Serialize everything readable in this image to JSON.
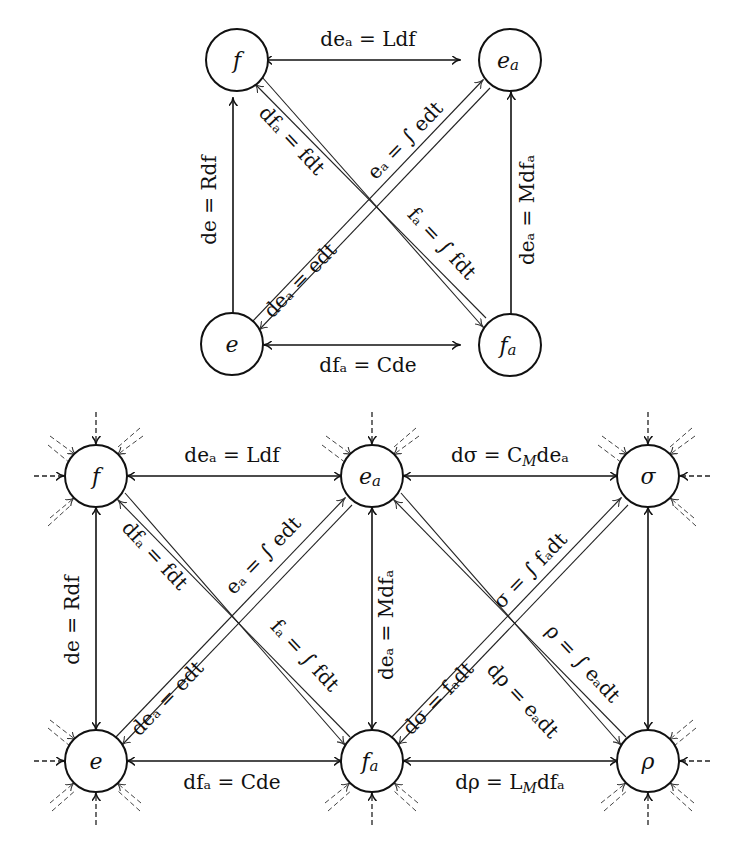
{
  "diagrams": [
    {
      "name": "top-diagram",
      "nodes": [
        {
          "id": "f",
          "label": "f",
          "x": 233,
          "y": 67
        },
        {
          "id": "ea",
          "label": "eₐ",
          "x": 491,
          "y": 67
        },
        {
          "id": "e",
          "label": "e",
          "x": 233,
          "y": 366
        },
        {
          "id": "fa",
          "label": "fₐ",
          "x": 491,
          "y": 366
        }
      ],
      "edges": [
        {
          "from": "f",
          "to": "ea",
          "type": "bidirectional",
          "label": "deₐ = L df"
        },
        {
          "from": "f",
          "to": "e",
          "type": "bidirectional",
          "label": "de = R df"
        },
        {
          "from": "ea",
          "to": "fa",
          "type": "bidirectional",
          "label": "deₐ = M dfₐ"
        },
        {
          "from": "e",
          "to": "fa",
          "type": "bidirectional",
          "label": "dfₐ = C de"
        },
        {
          "from": "e",
          "to": "ea",
          "type": "double-line",
          "label_upper": "eₐ = ∫ e dt",
          "label_lower": "deₐ = e dt"
        },
        {
          "from": "f",
          "to": "fa",
          "type": "double-line",
          "label_upper": "dfₐ = f dt",
          "label_lower": "fₐ = ∫ f dt"
        }
      ]
    },
    {
      "name": "bottom-diagram",
      "nodes": [
        {
          "id": "f",
          "label": "f",
          "x": 96,
          "y": 475
        },
        {
          "id": "ea",
          "label": "eₐ",
          "x": 372,
          "y": 475
        },
        {
          "id": "sigma",
          "label": "σ",
          "x": 648,
          "y": 475
        },
        {
          "id": "e",
          "label": "e",
          "x": 96,
          "y": 782
        },
        {
          "id": "fa",
          "label": "fₐ",
          "x": 372,
          "y": 782
        },
        {
          "id": "rho",
          "label": "ρ",
          "x": 648,
          "y": 782
        }
      ],
      "edges": [
        {
          "from": "f",
          "to": "ea",
          "type": "bidirectional",
          "label": "deₐ = L df"
        },
        {
          "from": "ea",
          "to": "sigma",
          "type": "bidirectional",
          "label": "dσ = C_M deₐ"
        },
        {
          "from": "f",
          "to": "e",
          "type": "bidirectional",
          "label": "de = R df"
        },
        {
          "from": "ea",
          "to": "fa",
          "type": "bidirectional",
          "label": "deₐ = M dfₐ"
        },
        {
          "from": "sigma",
          "to": "rho",
          "type": "bidirectional",
          "label": ""
        },
        {
          "from": "e",
          "to": "fa",
          "type": "bidirectional",
          "label": "dfₐ = C de"
        },
        {
          "from": "fa",
          "to": "rho",
          "type": "bidirectional",
          "label": "dρ = L_M dfₐ"
        },
        {
          "from": "e",
          "to": "ea",
          "type": "double-line",
          "label_upper": "eₐ = ∫ e dt",
          "label_lower": "deₐ = e dt"
        },
        {
          "from": "f",
          "to": "fa",
          "type": "double-line",
          "label_upper": "dfₐ = f dt",
          "label_lower": "fₐ = ∫ f dt"
        },
        {
          "from": "fa",
          "to": "sigma",
          "type": "double-line",
          "label_upper": "σ = ∫ fₐ dt",
          "label_lower": "dσ = fₐ dt"
        },
        {
          "from": "ea",
          "to": "rho",
          "type": "double-line",
          "label_upper": "ρ = ∫ eₐ dt",
          "label_lower": "dρ = eₐ dt"
        }
      ],
      "external_stubs": "dashed incoming arrows on outer sides of each node"
    }
  ],
  "labels": {
    "top": {
      "f": "f",
      "ea": "e",
      "ea_sub": "a",
      "e": "e",
      "fa": "f",
      "fa_sub": "a",
      "top_edge": "deₐ = Ldf",
      "left_edge": "de = Rdf",
      "right_edge": "deₐ = Mdfₐ",
      "bottom_edge": "dfₐ = Cde",
      "diag1_upper": "eₐ = ∫ edt",
      "diag1_lower": "deₐ = edt",
      "diag2_upper": "dfₐ = fdt",
      "diag2_lower": "fₐ = ∫ fdt"
    },
    "bottom": {
      "f": "f",
      "ea": "e",
      "ea_sub": "a",
      "sigma": "σ",
      "e": "e",
      "fa": "f",
      "fa_sub": "a",
      "rho": "ρ",
      "top_left_edge": "deₐ = Ldf",
      "top_right_edge_main": "dσ = C",
      "top_right_edge_sub": "M",
      "top_right_edge_tail": "deₐ",
      "left_edge": "de = Rdf",
      "mid_edge": "deₐ = Mdfₐ",
      "bottom_left_edge": "dfₐ = Cde",
      "bottom_right_edge_main": "dρ = L",
      "bottom_right_edge_sub": "M",
      "bottom_right_edge_tail": "dfₐ",
      "diagL1_upper": "eₐ = ∫ edt",
      "diagL1_lower": "deₐ = edt",
      "diagL2_upper": "dfₐ = fdt",
      "diagL2_lower": "fₐ = ∫ fdt",
      "diagR1_upper": "σ = ∫ fₐdt",
      "diagR1_lower": "dσ = fₐdt",
      "diagR2_upper": "ρ = ∫ eₐdt",
      "diagR2_lower": "dρ = eₐdt"
    }
  }
}
